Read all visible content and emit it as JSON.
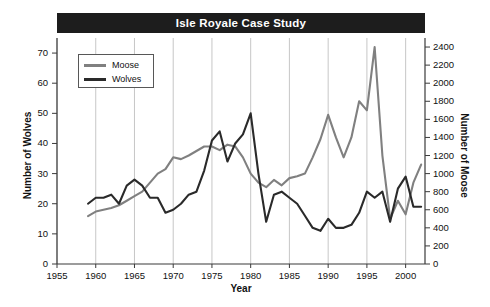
{
  "chart_data": {
    "type": "line",
    "title": "Isle Royale Case Study",
    "xlabel": "Year",
    "ylabel": "Number of Wolves",
    "ylabel_right": "Number of Moose",
    "xlim": [
      1955,
      2002.5
    ],
    "ylim": [
      0,
      75
    ],
    "ylim_right": [
      0,
      2500
    ],
    "xticks": [
      1955,
      1960,
      1965,
      1970,
      1975,
      1980,
      1985,
      1990,
      1995,
      2000
    ],
    "yticks_left": [
      0,
      10,
      20,
      30,
      40,
      50,
      60,
      70
    ],
    "yticks_right": [
      0,
      200,
      400,
      600,
      800,
      1000,
      1200,
      1400,
      1600,
      1800,
      2000,
      2200,
      2400
    ],
    "grid": "vertical",
    "legend_position": "top-left",
    "colors": {
      "moose": "#808080",
      "wolves": "#2a2a2a",
      "title_bar": "#1d1d1d",
      "title_text": "#ffffff",
      "axis": "#3a3a3a",
      "gridline": "#b9b9b9"
    },
    "series": [
      {
        "name": "Moose",
        "axis": "right",
        "color": "#808080",
        "x": [
          1959,
          1960,
          1961,
          1962,
          1963,
          1964,
          1965,
          1966,
          1967,
          1968,
          1969,
          1970,
          1971,
          1972,
          1973,
          1974,
          1975,
          1976,
          1977,
          1978,
          1979,
          1980,
          1981,
          1982,
          1983,
          1984,
          1985,
          1986,
          1987,
          1988,
          1989,
          1990,
          1991,
          1992,
          1993,
          1994,
          1995,
          1996,
          1997,
          1998,
          1999,
          2000,
          2001,
          2002
        ],
        "values": [
          530,
          580,
          600,
          620,
          650,
          700,
          750,
          800,
          900,
          1000,
          1050,
          1180,
          1160,
          1200,
          1250,
          1300,
          1300,
          1260,
          1320,
          1300,
          1180,
          1000,
          900,
          850,
          930,
          870,
          950,
          970,
          1000,
          1180,
          1380,
          1650,
          1400,
          1180,
          1400,
          1800,
          1700,
          2400,
          1200,
          500,
          700,
          550,
          900,
          1100
        ]
      },
      {
        "name": "Wolves",
        "axis": "left",
        "color": "#2a2a2a",
        "x": [
          1959,
          1960,
          1961,
          1962,
          1963,
          1964,
          1965,
          1966,
          1967,
          1968,
          1969,
          1970,
          1971,
          1972,
          1973,
          1974,
          1975,
          1976,
          1977,
          1978,
          1979,
          1980,
          1981,
          1982,
          1983,
          1984,
          1985,
          1986,
          1987,
          1988,
          1989,
          1990,
          1991,
          1992,
          1993,
          1994,
          1995,
          1996,
          1997,
          1998,
          1999,
          2000,
          2001,
          2002
        ],
        "values": [
          20,
          22,
          22,
          23,
          20,
          26,
          28,
          26,
          22,
          22,
          17,
          18,
          20,
          23,
          24,
          31,
          41,
          44,
          34,
          40,
          43,
          50,
          30,
          14,
          23,
          24,
          22,
          20,
          16,
          12,
          11,
          15,
          12,
          12,
          13,
          17,
          24,
          22,
          24,
          14,
          25,
          29,
          19,
          19
        ]
      }
    ]
  },
  "legend": {
    "entries": [
      {
        "label": "Moose",
        "color": "#808080"
      },
      {
        "label": "Wolves",
        "color": "#2a2a2a"
      }
    ]
  }
}
